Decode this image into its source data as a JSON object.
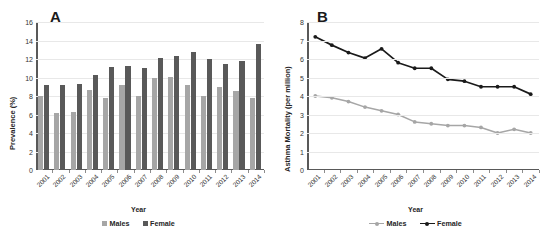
{
  "figure": {
    "panels": [
      {
        "letter": "A"
      },
      {
        "letter": "B"
      }
    ]
  },
  "panel_a": {
    "letter": "A",
    "ylabel": "Prevalence (%)",
    "xlabel": "Year",
    "legend": [
      {
        "label": "Males",
        "color": "#a6a6a6"
      },
      {
        "label": "Female",
        "color": "#595959"
      }
    ]
  },
  "panel_b": {
    "letter": "B",
    "ylabel": "Asthma Mortality (per million)",
    "xlabel": "Year",
    "legend": [
      {
        "label": "Males",
        "color": "#a6a6a6"
      },
      {
        "label": "Female",
        "color": "#1a1a1a"
      }
    ]
  },
  "chart_data": [
    {
      "type": "bar",
      "panel": "A",
      "title": "A",
      "xlabel": "Year",
      "ylabel": "Prevalence (%)",
      "categories": [
        "2001",
        "2002",
        "2003",
        "2004",
        "2005",
        "2006",
        "2007",
        "2008",
        "2009",
        "2010",
        "2011",
        "2012",
        "2013",
        "2014"
      ],
      "yticks": [
        0,
        2,
        4,
        6,
        8,
        10,
        12,
        14,
        16
      ],
      "ylim": [
        0,
        16
      ],
      "grid": true,
      "legend_position": "bottom",
      "series": [
        {
          "name": "Males",
          "color": "#a6a6a6",
          "values": [
            8.0,
            6.2,
            6.3,
            8.7,
            7.8,
            9.2,
            8.0,
            10.0,
            10.1,
            9.2,
            8.0,
            9.0,
            8.5,
            7.8
          ]
        },
        {
          "name": "Female",
          "color": "#595959",
          "values": [
            9.2,
            9.2,
            9.3,
            10.3,
            11.1,
            11.2,
            11.0,
            12.1,
            12.3,
            12.8,
            12.0,
            11.5,
            11.8,
            13.6
          ]
        }
      ]
    },
    {
      "type": "line",
      "panel": "B",
      "title": "B",
      "xlabel": "Year",
      "ylabel": "Asthma Mortality (per million)",
      "categories": [
        "2001",
        "2002",
        "2003",
        "2004",
        "2005",
        "2006",
        "2007",
        "2008",
        "2009",
        "2010",
        "2011",
        "2012",
        "2013",
        "2014"
      ],
      "yticks": [
        0,
        1,
        2,
        3,
        4,
        5,
        6,
        7,
        8
      ],
      "ylim": [
        0,
        8
      ],
      "grid": true,
      "markers": true,
      "legend_position": "bottom",
      "series": [
        {
          "name": "Males",
          "color": "#a6a6a6",
          "values": [
            4.0,
            3.9,
            3.7,
            3.4,
            3.2,
            3.0,
            2.6,
            2.5,
            2.4,
            2.4,
            2.3,
            2.0,
            2.2,
            2.0
          ]
        },
        {
          "name": "Female",
          "color": "#1a1a1a",
          "values": [
            7.2,
            6.75,
            6.35,
            6.05,
            6.55,
            5.8,
            5.5,
            5.5,
            4.9,
            4.8,
            4.5,
            4.5,
            4.5,
            4.1
          ]
        }
      ]
    }
  ]
}
